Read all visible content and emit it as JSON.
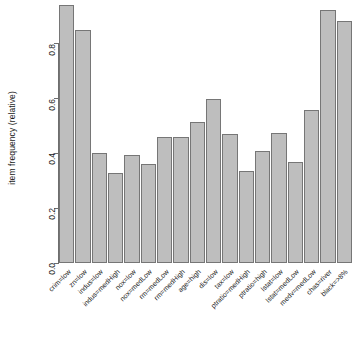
{
  "chart_data": {
    "type": "bar",
    "title": "",
    "subtitle": "",
    "xlabel": "",
    "ylabel": "item frequency (relative)",
    "ylim": [
      0.0,
      0.96
    ],
    "axis_max_drawn": 0.96,
    "grid": false,
    "legend": null,
    "bar_fill_color": "#bebebe",
    "bar_border_color": "#767676",
    "background_color": "#ffffff",
    "text_color": "#1a1a1a",
    "axis_color": "#6e6e6e",
    "ytick_labels": [
      "0.0",
      "0.2",
      "0.4",
      "0.6",
      "0.8"
    ],
    "ytick_values": [
      0.0,
      0.2,
      0.4,
      0.6,
      0.8
    ],
    "categories": [
      "crim=low",
      "zn=low",
      "indus=low",
      "indus=medHigh",
      "nox=low",
      "nox=medLow",
      "rm=medLow",
      "rm=medHigh",
      "age=high",
      "dis=low",
      "tax=low",
      "ptratio=medHigh",
      "ptratio=high",
      "lstat=low",
      "lstat=medLow",
      "medv=medLow",
      "chas=river",
      "black=>8%"
    ],
    "values": [
      0.94,
      0.85,
      0.4,
      0.33,
      0.395,
      0.36,
      0.46,
      0.46,
      0.515,
      0.6,
      0.47,
      0.335,
      0.41,
      0.475,
      0.37,
      0.56,
      0.925,
      0.885
    ]
  }
}
